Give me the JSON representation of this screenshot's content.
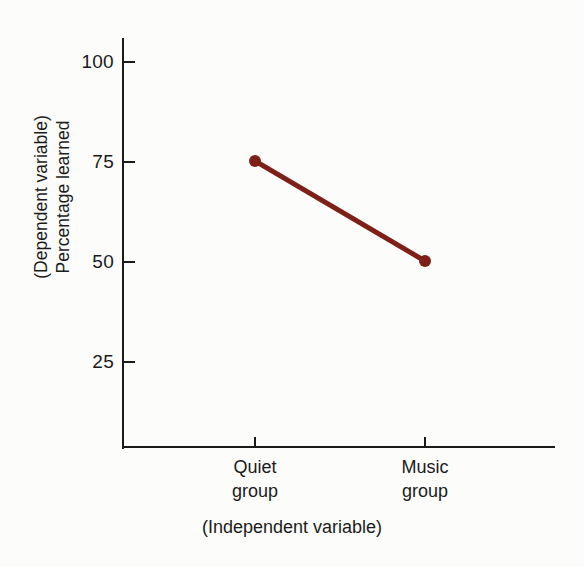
{
  "figure": {
    "background_color": "#fcfcfa",
    "axis_color": "#1a1a1a",
    "series_color": "#7e2017"
  },
  "axis": {
    "y_caption_line1": "(Dependent variable)",
    "y_caption_line2": "Percentage learned",
    "x_caption": "(Independent variable)",
    "y_ticks": [
      {
        "label": "100",
        "value": 100
      },
      {
        "label": "75",
        "value": 75
      },
      {
        "label": "50",
        "value": 50
      },
      {
        "label": "25",
        "value": 25
      }
    ],
    "x_groups": [
      {
        "line1": "Quiet",
        "line2": "group"
      },
      {
        "line1": "Music",
        "line2": "group"
      }
    ]
  },
  "chart_data": {
    "type": "line",
    "title": "",
    "subtitle": "",
    "xlabel": "(Independent variable)",
    "ylabel": "(Dependent variable) Percentage learned",
    "categories": [
      "Quiet group",
      "Music group"
    ],
    "values": [
      75,
      50
    ],
    "series": [
      {
        "name": "Percentage learned",
        "values": [
          75,
          50
        ],
        "color": "#7e2017",
        "marker": "filled-circle",
        "line_width": 5
      }
    ],
    "ylim": [
      0,
      100
    ],
    "y_ticks": [
      25,
      50,
      75,
      100
    ],
    "x_tick_labels": [
      "Quiet group",
      "Music group"
    ],
    "grid": false,
    "legend": false,
    "legend_position": "none",
    "annotations": []
  }
}
